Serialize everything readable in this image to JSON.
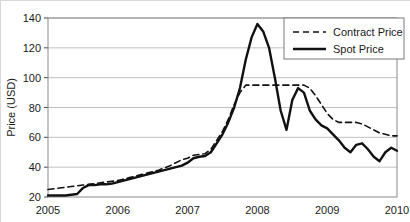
{
  "chart_data": {
    "type": "line",
    "title": "",
    "xlabel": "",
    "ylabel": "Price (USD)",
    "xlim": [
      2005,
      2010
    ],
    "ylim": [
      20,
      140
    ],
    "yticks": [
      20,
      40,
      60,
      80,
      100,
      120,
      140
    ],
    "xticks": [
      2005,
      2006,
      2007,
      2008,
      2009,
      2010
    ],
    "xtick_labels": [
      "2005",
      "2006",
      "2007",
      "2008",
      "2009",
      "2010"
    ],
    "ytick_labels": [
      "20",
      "40",
      "60",
      "80",
      "100",
      "120",
      "140"
    ],
    "grid": true,
    "legend_position": "top-right",
    "legend_entries": [
      "Contract Price",
      "Spot Price"
    ],
    "colors": {
      "line": "#111111",
      "grid": "#b0b0b0",
      "frame": "#8a8a8a",
      "background": "#ffffff"
    },
    "x": [
      2005.0,
      2005.083,
      2005.167,
      2005.25,
      2005.333,
      2005.417,
      2005.5,
      2005.583,
      2005.667,
      2005.75,
      2005.833,
      2005.917,
      2006.0,
      2006.083,
      2006.167,
      2006.25,
      2006.333,
      2006.417,
      2006.5,
      2006.583,
      2006.667,
      2006.75,
      2006.833,
      2006.917,
      2007.0,
      2007.083,
      2007.167,
      2007.25,
      2007.333,
      2007.417,
      2007.5,
      2007.583,
      2007.667,
      2007.75,
      2007.833,
      2007.917,
      2008.0,
      2008.083,
      2008.167,
      2008.25,
      2008.333,
      2008.417,
      2008.5,
      2008.583,
      2008.667,
      2008.75,
      2008.833,
      2008.917,
      2009.0,
      2009.083,
      2009.167,
      2009.25,
      2009.333,
      2009.417,
      2009.5,
      2009.583,
      2009.667,
      2009.75,
      2009.833,
      2009.917,
      2010.0
    ],
    "series": [
      {
        "name": "Spot Price",
        "style": "solid",
        "values": [
          21,
          21,
          21,
          21,
          21.5,
          22,
          26,
          28,
          28,
          28.5,
          28.5,
          29,
          30,
          31,
          32,
          33,
          34,
          35,
          36,
          37,
          38,
          39,
          40,
          41,
          43,
          46,
          47,
          47.5,
          50,
          56,
          62,
          70,
          80,
          93,
          112,
          127,
          136,
          131,
          120,
          100,
          78,
          65,
          85,
          93,
          90,
          78,
          72,
          68,
          66,
          62,
          58,
          53,
          50,
          55,
          56,
          52,
          47,
          44,
          50,
          53,
          51
        ]
      },
      {
        "name": "Contract Price",
        "style": "dashed",
        "values": [
          25,
          25.5,
          26,
          26.5,
          27,
          27.5,
          28,
          28.5,
          29,
          29.5,
          30,
          30.5,
          31,
          32,
          33,
          34,
          35,
          36,
          37,
          38,
          39.5,
          41,
          43,
          45,
          46,
          48,
          48.5,
          49,
          52,
          58,
          64,
          72,
          82,
          90,
          95,
          95,
          95,
          95,
          95,
          95,
          95,
          95,
          95,
          95,
          95,
          93,
          88,
          82,
          76,
          72,
          70,
          70,
          70,
          70,
          69,
          67,
          65,
          63,
          62,
          61,
          61
        ]
      }
    ]
  }
}
